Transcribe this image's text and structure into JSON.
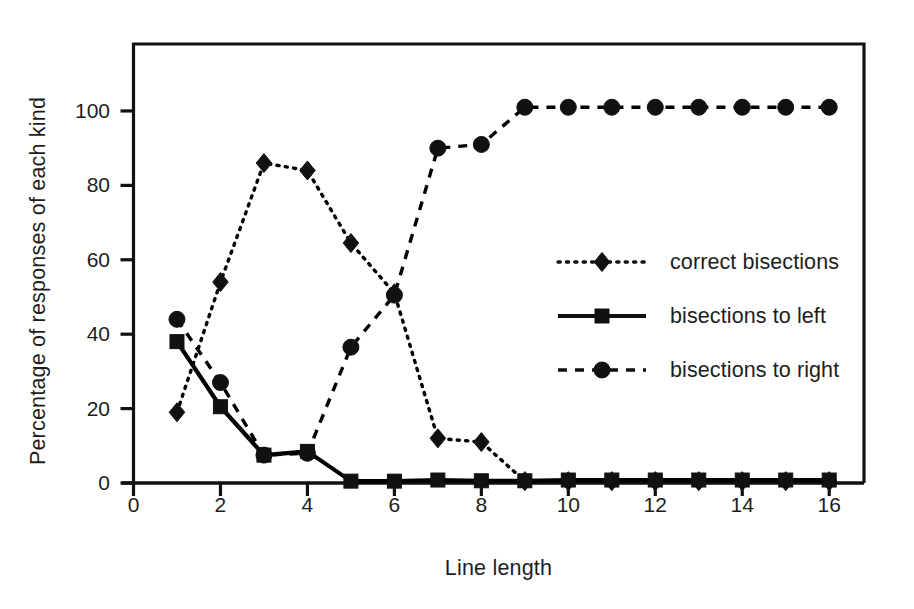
{
  "chart_data": {
    "type": "line",
    "title": "",
    "xlabel": "Line length",
    "ylabel": "Percentage of responses of each kind",
    "xlim": [
      0,
      16.8
    ],
    "ylim": [
      0,
      118
    ],
    "xticks": [
      0,
      2,
      4,
      6,
      8,
      10,
      12,
      14,
      16
    ],
    "xtick_labels": [
      "0",
      "2",
      "4",
      "6",
      "8",
      "10",
      "12",
      "14",
      "16"
    ],
    "yticks": [
      0,
      20,
      40,
      60,
      80,
      100
    ],
    "ytick_labels": [
      "0",
      "20",
      "40",
      "60",
      "80",
      "100"
    ],
    "grid": false,
    "legend_position": "center right",
    "x": [
      1,
      2,
      3,
      4,
      5,
      6,
      7,
      8,
      9,
      10,
      11,
      12,
      13,
      14,
      15,
      16
    ],
    "series": [
      {
        "name": "correct bisections",
        "marker": "diamond",
        "linestyle": "dotted",
        "color": "#000000",
        "values": [
          19,
          54,
          86,
          84,
          64.5,
          51,
          12,
          11,
          0.5,
          0.5,
          0.5,
          0.5,
          0.5,
          0.5,
          0.5,
          0.5
        ]
      },
      {
        "name": "bisections to left",
        "marker": "square",
        "linestyle": "solid",
        "color": "#000000",
        "values": [
          38,
          20.5,
          7.5,
          8.5,
          0.5,
          0.5,
          0.8,
          0.6,
          0.6,
          0.8,
          0.8,
          0.8,
          0.8,
          0.8,
          0.8,
          0.8
        ]
      },
      {
        "name": "bisections to right",
        "marker": "circle",
        "linestyle": "dashed",
        "color": "#000000",
        "values": [
          44,
          27,
          7.5,
          8,
          36.5,
          50.5,
          90,
          91,
          101,
          101,
          101,
          101,
          101,
          101,
          101,
          101
        ]
      }
    ]
  },
  "legend": {
    "items": [
      {
        "label": "correct bisections",
        "marker": "diamond",
        "linestyle": "dotted"
      },
      {
        "label": "bisections to left",
        "marker": "square",
        "linestyle": "solid"
      },
      {
        "label": "bisections to right",
        "marker": "circle",
        "linestyle": "dashed"
      }
    ]
  },
  "axes": {
    "frame_color": "#111111"
  }
}
